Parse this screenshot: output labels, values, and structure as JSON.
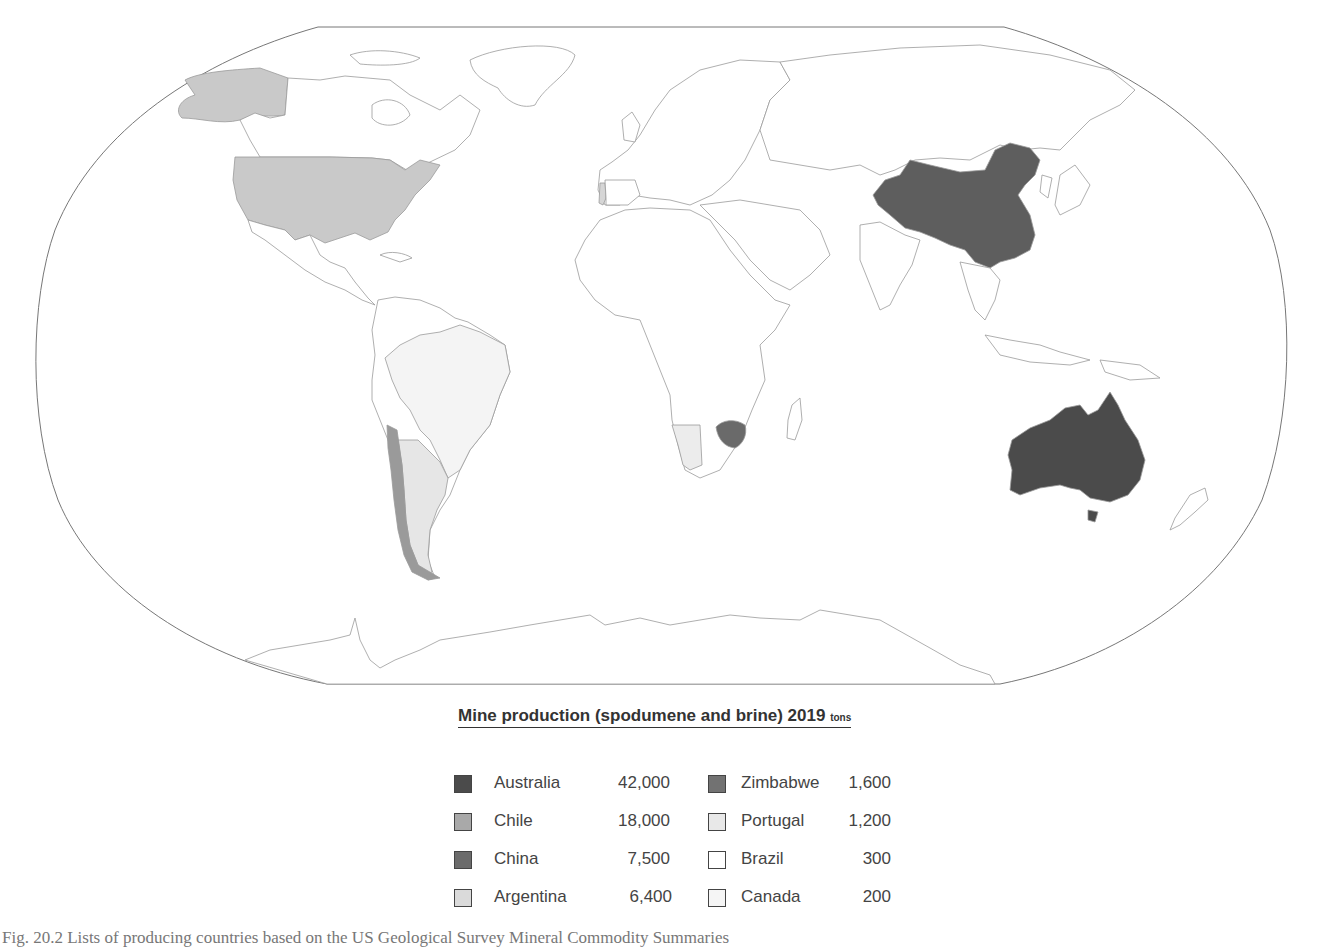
{
  "map": {
    "projection": "Robinson",
    "shading": {
      "Australia": "#4b4b4b",
      "China": "#5e5e5e",
      "Zimbabwe": "#6a6a6a",
      "Chile": "#9a9a9a",
      "United States": "#c9c9c9",
      "Argentina": "#e6e6e6",
      "Portugal": "#d6d6d6",
      "Brazil": "#f4f4f4",
      "Canada": "#ffffff",
      "Namibia": "#e8e8e8"
    }
  },
  "legend": {
    "title": "Mine production (spodumene and brine) 2019",
    "unit": "tons",
    "items": [
      {
        "country": "Australia",
        "value": "42,000",
        "color": "#4b4b4b"
      },
      {
        "country": "Chile",
        "value": "18,000",
        "color": "#a9a9a9"
      },
      {
        "country": "China",
        "value": "7,500",
        "color": "#6b6b6b"
      },
      {
        "country": "Argentina",
        "value": "6,400",
        "color": "#dadada"
      },
      {
        "country": "Zimbabwe",
        "value": "1,600",
        "color": "#727272"
      },
      {
        "country": "Portugal",
        "value": "1,200",
        "color": "#e8e8e8"
      },
      {
        "country": "Brazil",
        "value": "300",
        "color": "#ffffff"
      },
      {
        "country": "Canada",
        "value": "200",
        "color": "#f5f5f5"
      }
    ]
  },
  "caption": "Fig. 20.2  Lists of producing countries based on the US Geological Survey Mineral Commodity Summaries"
}
